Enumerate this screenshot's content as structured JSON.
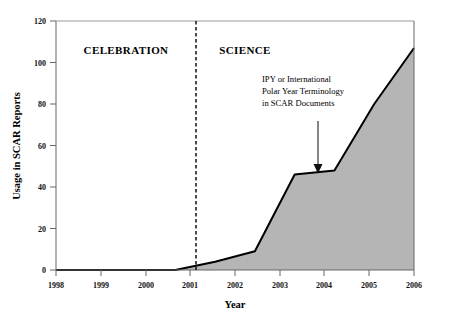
{
  "chart_data": {
    "type": "area",
    "title": "",
    "xlabel": "Year",
    "ylabel": "Usage in SCAR Reports",
    "x": [
      1998,
      1999,
      2000,
      2001,
      2002,
      2003,
      2004,
      2005,
      2006,
      2007
    ],
    "values": [
      0,
      0,
      0,
      0,
      4,
      9,
      46,
      48,
      80,
      107
    ],
    "series": [
      {
        "name": "IPY or International Polar Year Terminology in SCAR Documents",
        "values": [
          0,
          0,
          0,
          0,
          4,
          9,
          46,
          48,
          80,
          107
        ]
      }
    ],
    "xlim": [
      1998,
      2007
    ],
    "ylim": [
      0,
      120
    ],
    "xticks": [
      "1998",
      "1999",
      "2000",
      "2001",
      "2002",
      "2003",
      "2004",
      "2005",
      "2006",
      "2007"
    ],
    "yticks": [
      "0",
      "20",
      "40",
      "60",
      "80",
      "100",
      "120"
    ],
    "ytick_values": [
      0,
      20,
      40,
      60,
      80,
      100,
      120
    ],
    "grid": false,
    "legend": "none",
    "fill_color": "#b5b5b5",
    "line_color": "#000000",
    "axis_color": "#555555",
    "annotations": [
      {
        "name": "celebration-region-label",
        "text": "CELEBRATION",
        "x": 1999.55,
        "y": 101
      },
      {
        "name": "science-region-label",
        "text": "SCIENCE",
        "x": 2001.75,
        "y": 101
      },
      {
        "name": "divider-line",
        "text": "",
        "x": 2001.14,
        "y": 0,
        "style": "dashed-vertical"
      },
      {
        "name": "callout-text",
        "lines": [
          "IPY or International",
          "Polar Year Terminology",
          "in SCAR Documents"
        ],
        "x": 2002.68,
        "y": 90
      },
      {
        "name": "callout-arrow",
        "text": "",
        "x": 2003.84,
        "y_from": 71.5,
        "y_to": 47.5,
        "style": "down-arrow"
      }
    ]
  },
  "axes": {
    "y_title": "Usage in SCAR Reports",
    "x_title": "Year"
  }
}
